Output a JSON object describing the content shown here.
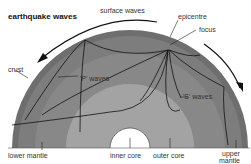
{
  "title": "earthquake waves",
  "labels": {
    "surface_waves": "surface waves",
    "epicentre": "epicentre",
    "focus": "focus",
    "crust": "crust",
    "p_waves": "'P' waves",
    "s_waves": "'S' waves",
    "lower_mantle": "lower mantle",
    "inner_core": "inner core",
    "outer_core": "outer core",
    "upper_mantle_line1": "upper",
    "upper_mantle_line2": "mantle"
  },
  "colors": {
    "crust": "#6e6e6e",
    "upper_mantle": "#7f7f7f",
    "lower_mantle": "#8c8c8c",
    "outer_core": "#a6a6a6",
    "inner_core": "#ffffff",
    "lines": "#111111"
  }
}
